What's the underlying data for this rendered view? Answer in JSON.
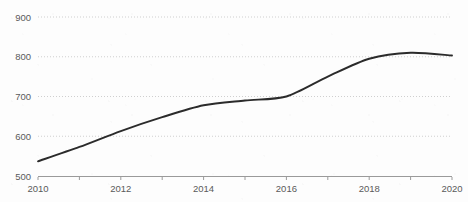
{
  "chart_data": {
    "type": "line",
    "title": "",
    "subtitle": "",
    "xlabel": "",
    "ylabel": "",
    "x": [
      2010,
      2011,
      2012,
      2013,
      2014,
      2015,
      2016,
      2017,
      2018,
      2019,
      2020
    ],
    "values": [
      537,
      573,
      613,
      648,
      678,
      690,
      700,
      750,
      795,
      810,
      803
    ],
    "series": [
      {
        "name": "",
        "values": [
          537,
          573,
          613,
          648,
          678,
          690,
          700,
          750,
          795,
          810,
          803
        ]
      }
    ],
    "xlim": [
      2010,
      2020
    ],
    "ylim": [
      500,
      900
    ],
    "x_tick_labels": [
      "2010",
      "2012",
      "2014",
      "2016",
      "2018",
      "2020"
    ],
    "x_tick_values": [
      2010,
      2012,
      2014,
      2016,
      2018,
      2020
    ],
    "x_minor_tick_values": [
      2010,
      2011,
      2012,
      2013,
      2014,
      2015,
      2016,
      2017,
      2018,
      2019,
      2020
    ],
    "y_tick_labels": [
      "500",
      "600",
      "700",
      "800",
      "900"
    ],
    "y_tick_values": [
      500,
      600,
      700,
      800,
      900
    ],
    "grid": true,
    "grid_axis": "y",
    "legend": false,
    "legend_position": "none",
    "annotations": []
  },
  "style": {
    "background_color": "#fdfdfd",
    "line_color": "#2b2b2b",
    "gridline_color": "#cfcfcf",
    "axis_color": "#9a9a9a",
    "tick_label_color": "#5a5a5a"
  }
}
